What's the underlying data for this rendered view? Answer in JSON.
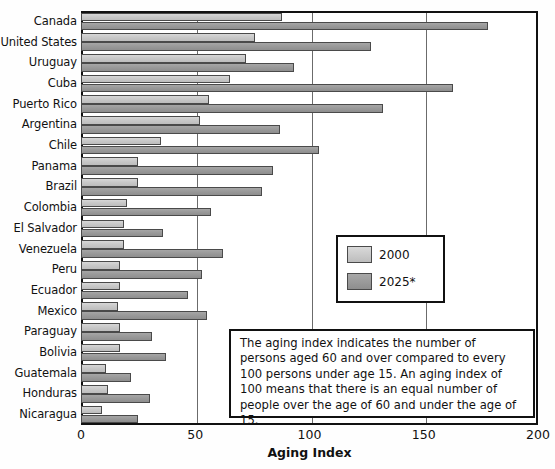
{
  "chart_data": {
    "type": "bar",
    "orientation": "horizontal",
    "title": "",
    "xlabel": "Aging Index",
    "ylabel": "",
    "xlim": [
      0,
      200
    ],
    "xticks": [
      0,
      50,
      100,
      150,
      200
    ],
    "grid": true,
    "grid_axis": "x",
    "legend_position": "center-right",
    "categories": [
      "Canada",
      "United States",
      "Uruguay",
      "Cuba",
      "Puerto Rico",
      "Argentina",
      "Chile",
      "Panama",
      "Brazil",
      "Colombia",
      "El Salvador",
      "Venezuela",
      "Peru",
      "Ecuador",
      "Mexico",
      "Paraguay",
      "Bolivia",
      "Guatemala",
      "Honduras",
      "Nicaragua"
    ],
    "series": [
      {
        "name": "2000",
        "color": "#c9c9c9",
        "values": [
          88,
          76,
          72,
          65,
          56,
          52,
          35,
          25,
          25,
          20,
          19,
          19,
          17,
          17,
          16,
          17,
          17,
          11,
          12,
          9
        ]
      },
      {
        "name": "2025*",
        "color": "#9a9a9a",
        "values": [
          178,
          127,
          93,
          163,
          132,
          87,
          104,
          84,
          79,
          57,
          36,
          62,
          53,
          47,
          55,
          31,
          37,
          22,
          30,
          25
        ]
      }
    ],
    "annotations": [
      "The aging index indicates the number of persons aged 60 and over compared to every 100 persons under age 15. An aging index of 100 means that there is an equal number of people over the age of 60 and under the age of 15."
    ]
  },
  "legend": {
    "items": [
      {
        "label": "2000",
        "swatch": "light-gray-swatch"
      },
      {
        "label": "2025*",
        "swatch": "dark-gray-swatch"
      }
    ]
  },
  "axis": {
    "x_title": "Aging Index",
    "x_tick_labels": [
      "0",
      "50",
      "100",
      "150",
      "200"
    ]
  },
  "annotation": {
    "text": "The aging index indicates the number of persons aged 60 and over compared to every 100 persons under age 15. An aging index of 100 means that there is an equal number of people over the age of 60 and under the age of 15."
  },
  "colors": {
    "series_2000": "#c9c9c9",
    "series_2025": "#9a9a9a",
    "frame": "#111111",
    "gridline": "#6b6b6b",
    "background": "#ffffff"
  }
}
